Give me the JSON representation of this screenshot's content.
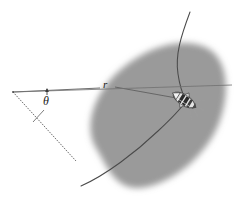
{
  "figure": {
    "name": "orbital-geometry-diagram",
    "type": "schematic",
    "background": "#ffffff",
    "width": 237,
    "height": 214
  },
  "labels": {
    "radius": "r",
    "angle": "θ"
  },
  "colors": {
    "body_fill": "#9a9a9a",
    "body_edge": "#b4b4b4",
    "line": "#555555",
    "curve": "#4a4a4a",
    "spacecraft_dark": "#2b2b2b",
    "spacecraft_light": "#e8e8e8",
    "text": "#1a1a1a"
  },
  "elements": {
    "body_label": "gray-elliptical-body",
    "trajectory_label": "trajectory-curve",
    "radius_line_label": "radius-line",
    "upper_ray_label": "angle-upper-ray",
    "lower_ray_label": "angle-lower-ray",
    "vertex_label": "angle-vertex",
    "arc_tick_label": "angle-arc-tick",
    "arrow_label": "angle-arrow-tick",
    "spacecraft_label": "spacecraft"
  },
  "geometry": {
    "vertex": [
      13,
      92
    ],
    "spacecraft": [
      184,
      100
    ],
    "radius_end": [
      184,
      100
    ],
    "lower_ray_end": [
      76,
      161
    ],
    "curve_start": [
      190,
      12
    ],
    "curve_end": [
      81,
      186
    ],
    "body_center": [
      157,
      120
    ],
    "body_rx": 72,
    "body_ry": 52,
    "body_rotation_deg": -27
  }
}
